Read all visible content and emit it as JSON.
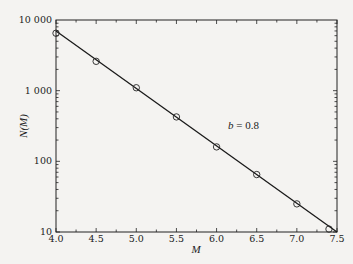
{
  "chart_data": {
    "type": "scatter",
    "title": "",
    "xlabel": "M",
    "ylabel": "N(M)",
    "xlim": [
      4.0,
      7.5
    ],
    "ylim": [
      10,
      10000
    ],
    "yscale": "log",
    "grid": false,
    "legend": null,
    "x_ticks": [
      "4.0",
      "4.5",
      "5.0",
      "5.5",
      "6.0",
      "6.5",
      "7.0",
      "7.5"
    ],
    "y_ticks": [
      "10",
      "100",
      "1 000",
      "10 000"
    ],
    "series": [
      {
        "name": "observed",
        "marker": "open-circle",
        "x": [
          4.0,
          4.5,
          5.0,
          5.5,
          6.0,
          6.5,
          7.0,
          7.4
        ],
        "y": [
          6500,
          2600,
          1100,
          425,
          160,
          65,
          25,
          11
        ]
      },
      {
        "name": "fit",
        "style": "line",
        "x": [
          4.0,
          7.5
        ],
        "y": [
          7000,
          10
        ]
      }
    ],
    "annotations": [
      {
        "text": "b = 0.8",
        "x": 6.1,
        "y": 250
      }
    ]
  },
  "annotation_text": {
    "b": "b",
    "eq": " = 0.8"
  }
}
